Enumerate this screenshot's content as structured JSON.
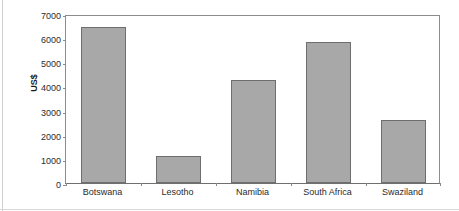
{
  "chart_data": {
    "type": "bar",
    "title": "",
    "xlabel": "",
    "ylabel": "US$",
    "categories": [
      "Botswana",
      "Lesotho",
      "Namibia",
      "South Africa",
      "Swaziland"
    ],
    "values": [
      6450,
      1100,
      4250,
      5850,
      2600
    ],
    "ylim": [
      0,
      7000
    ],
    "yticks": [
      0,
      1000,
      2000,
      3000,
      4000,
      5000,
      6000,
      7000
    ],
    "ytick_labels": [
      "0",
      "1000",
      "2000",
      "3000",
      "4000",
      "5000",
      "6000",
      "7000"
    ],
    "grid": false,
    "legend": null,
    "bar_color": "#a8a8a8",
    "bar_edge_color": "#6e6e6e",
    "axis_color": "#8c8c8c",
    "background": "#ffffff"
  }
}
